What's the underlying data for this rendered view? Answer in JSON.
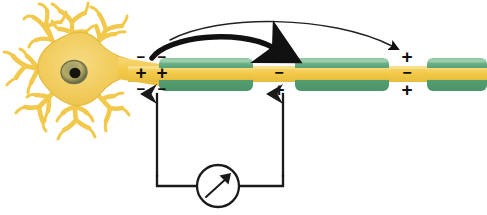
{
  "figure": {
    "background_color": "#ffffff"
  },
  "colors": {
    "soma_fill": "#f2cf61",
    "soma_edge": "#e8bb3f",
    "dendrite": "#f2c94c",
    "nucleus_ring": "#7c7f52",
    "nucleus_center": "#1a1a18",
    "axon": "#f5cc55",
    "myelin": "#5aa377",
    "myelin_light": "#8cc6a0",
    "myelin_dark": "#3e8a60",
    "wire": "#1a1a1a",
    "arrow": "#111111",
    "charge_text": "#111111"
  },
  "neuron": {
    "soma_label": "cell-body",
    "nucleus_label": "nucleus",
    "dendrite_label": "dendrite",
    "axon_label": "axon"
  },
  "myelin_segments": [
    {
      "id": 1,
      "x": 159,
      "y": 58,
      "width": 94,
      "height": 33
    },
    {
      "id": 2,
      "x": 295,
      "y": 58,
      "width": 94,
      "height": 33
    },
    {
      "id": 3,
      "x": 427,
      "y": 58,
      "width": 60,
      "height": 33
    }
  ],
  "nodes": [
    {
      "id": "node-1",
      "state": "depolarized",
      "x": 140,
      "charges_left": [
        "−",
        "+",
        "−"
      ],
      "charges_right": [
        "−",
        "+",
        "−"
      ]
    },
    {
      "id": "node-2",
      "state": "resting",
      "x": 278,
      "charges": [
        "+",
        "−",
        "+"
      ]
    },
    {
      "id": "node-3",
      "state": "resting",
      "x": 406,
      "charges": [
        "+",
        "−",
        "+"
      ]
    }
  ],
  "arrows": [
    {
      "id": "impulse-arrow-1",
      "style": "thick",
      "from_x": 152,
      "to_x": 278,
      "label": "impulse jump 1"
    },
    {
      "id": "impulse-arrow-2",
      "style": "thin",
      "from_x": 170,
      "to_x": 398,
      "label": "impulse jump 2"
    }
  ],
  "electrodes": [
    {
      "id": "electrode-left",
      "x": 157,
      "tip_y": 92,
      "bottom_y": 176
    },
    {
      "id": "electrode-right",
      "x": 283,
      "tip_y": 92,
      "bottom_y": 176
    }
  ],
  "meter": {
    "label": "voltmeter",
    "cx": 218,
    "cy": 186,
    "r": 21,
    "needle_angle_deg": -48
  }
}
